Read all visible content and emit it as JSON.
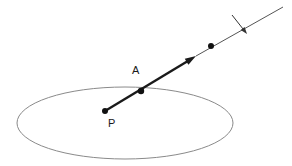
{
  "figure": {
    "background_color": "#ffffff",
    "width": 292,
    "height": 166
  },
  "colors": {
    "ray_thick": "#1a1a1a",
    "ray_thin": "#555555",
    "ellipse_stroke": "#8a8a8a",
    "point_fill": "#111111",
    "label_color": "#1a1a1a",
    "cross_arrow": "#333333"
  },
  "plane": {
    "shape_name": "ellipse",
    "center_x": 125,
    "center_y": 123,
    "radius_x": 108,
    "radius_y": 36,
    "stroke_width": 1
  },
  "points": [
    {
      "id": "P",
      "label": "P",
      "x": 105,
      "y": 111,
      "radius": 3,
      "label_x": 108,
      "label_y": 127
    },
    {
      "id": "A",
      "label": "A",
      "x": 141,
      "y": 91,
      "radius": 3.2,
      "label_x": 132,
      "label_y": 74
    },
    {
      "id": "Q",
      "label": "",
      "x": 211,
      "y": 46,
      "radius": 3,
      "label_x": 0,
      "label_y": 0
    }
  ],
  "ray": {
    "name": "directed-ray",
    "start_x": 105,
    "start_y": 111,
    "arrow_tip_x": 196,
    "arrow_tip_y": 56,
    "end_x": 283,
    "end_y": 7,
    "thick_width": 2.4,
    "thin_width": 1,
    "arrow_head_length": 11,
    "arrow_head_width": 7
  },
  "cross_arrow": {
    "name": "crossing-arrow",
    "start_x": 232,
    "start_y": 15,
    "end_x": 247,
    "end_y": 34,
    "stroke_width": 1,
    "head_length": 7,
    "head_width": 5
  },
  "labels": {
    "point_a": "A",
    "point_p": "P"
  }
}
